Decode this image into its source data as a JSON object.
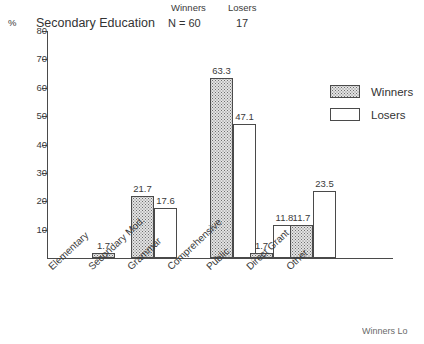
{
  "header": {
    "percent_symbol": "%",
    "title": "Secondary Education",
    "winners_label": "Winners",
    "losers_label": "Losers",
    "n_winners": "N = 60",
    "n_losers": "17"
  },
  "legend": {
    "winners": "Winners",
    "losers": "Losers"
  },
  "footer_bleed": {
    "text": "Winners  Lo"
  },
  "colors": {
    "axis": "#4a4a4a",
    "winners_fill": "#e3e3e3",
    "winners_dots": "#6e6e6e",
    "losers_fill": "#ffffff",
    "text": "#333333"
  },
  "chart_data": {
    "type": "bar",
    "title": "Secondary Education",
    "xlabel": "",
    "ylabel": "%",
    "ylim": [
      0,
      80
    ],
    "yticks": [
      0,
      10,
      20,
      30,
      40,
      50,
      60,
      70,
      80
    ],
    "ytick_labels": [
      "",
      "10",
      "20",
      "30",
      "40",
      "50",
      "60",
      "70",
      "80"
    ],
    "grid": false,
    "legend_position": "right",
    "categories": [
      "Elementary",
      "Secondary Mod.",
      "Grammar",
      "Comprehensive",
      "Public",
      "Direct Grant",
      "Other"
    ],
    "series": [
      {
        "name": "Winners",
        "n": 60,
        "values": [
          0,
          1.7,
          21.7,
          0,
          63.3,
          1.7,
          11.7
        ],
        "labels": [
          "",
          "1.7",
          "21.7",
          "",
          "63.3",
          "1.7",
          "11.7"
        ]
      },
      {
        "name": "Losers",
        "n": 17,
        "values": [
          0,
          0,
          17.6,
          0,
          47.1,
          11.8,
          23.5
        ],
        "labels": [
          "",
          "",
          "17.6",
          "",
          "47.1",
          "11.8",
          "23.5"
        ]
      }
    ]
  }
}
